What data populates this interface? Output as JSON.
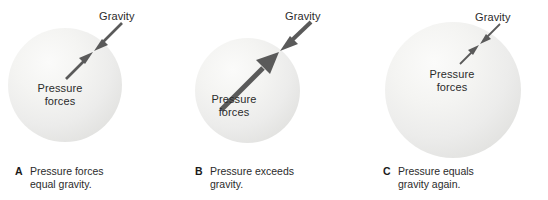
{
  "figure": {
    "background_color": "#ffffff",
    "arrow_color": "#5a5a5a",
    "sphere_color": "#ededeb",
    "text_color": "#2b2b2b"
  },
  "panels": [
    {
      "letter": "A",
      "caption_line1": "Pressure forces",
      "caption_line2": "equal gravity.",
      "gravity_label": "Gravity",
      "pressure_label_line1": "Pressure",
      "pressure_label_line2": "forces",
      "gravity_arrow": "medium inward arrow from upper right",
      "pressure_arrow": "medium outward arrow from lower left",
      "balance": "equal"
    },
    {
      "letter": "B",
      "caption_line1": "Pressure exceeds",
      "caption_line2": "gravity.",
      "gravity_label": "Gravity",
      "pressure_label_line1": "Pressure",
      "pressure_label_line2": "forces",
      "gravity_arrow": "short thick inward arrow from upper right",
      "pressure_arrow": "long thick outward arrow from lower left",
      "balance": "pressure greater"
    },
    {
      "letter": "C",
      "caption_line1": "Pressure equals",
      "caption_line2": "gravity again.",
      "gravity_label": "Gravity",
      "pressure_label_line1": "Pressure",
      "pressure_label_line2": "forces",
      "gravity_arrow": "short thin inward arrow from upper right",
      "pressure_arrow": "short thin outward arrow from lower left",
      "balance": "equal"
    }
  ]
}
